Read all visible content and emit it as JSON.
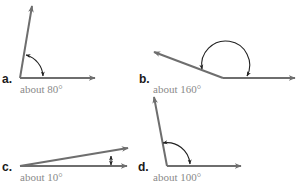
{
  "colors": {
    "ray": "#6e6e6e",
    "arc": "#222222",
    "label": "#1a1a1a",
    "caption": "#8a8a8a",
    "background": "#ffffff"
  },
  "angles": [
    {
      "id": "a",
      "label": "a.",
      "caption": "about 80°",
      "degrees": 80
    },
    {
      "id": "b",
      "label": "b.",
      "caption": "about 160°",
      "degrees": 160
    },
    {
      "id": "c",
      "label": "c.",
      "caption": "about 10°",
      "degrees": 10
    },
    {
      "id": "d",
      "label": "d.",
      "caption": "about 100°",
      "degrees": 100
    }
  ]
}
